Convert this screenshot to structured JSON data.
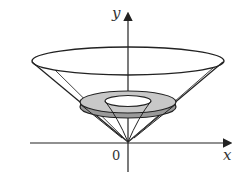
{
  "diagram": {
    "type": "solid of revolution",
    "labels": {
      "y_axis": "y",
      "x_axis": "x",
      "origin": "0"
    },
    "colors": {
      "stroke": "#222222",
      "washer_fill": "#c8c8c8",
      "background": "#ffffff"
    }
  }
}
